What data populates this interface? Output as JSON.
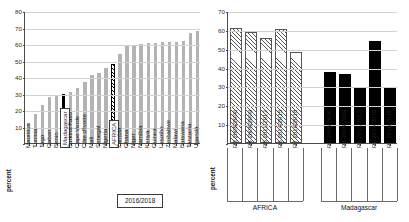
{
  "units_label": "percent",
  "legend": {
    "period_label": "2016/2018"
  },
  "chart_data": [
    {
      "type": "bar",
      "id": "country-ranking",
      "title": "",
      "xlabel": "",
      "ylabel": "percent",
      "ylim": [
        0,
        80
      ],
      "yticks": [
        10,
        20,
        30,
        40,
        50,
        60,
        70,
        80
      ],
      "grid": true,
      "legend_position": "inside-bottom-right",
      "annotations": [
        "2016/2018"
      ],
      "highlight_categories": [
        "Madagascar",
        "AFRICA"
      ],
      "categories": [
        "Mauritius",
        "Tunisia",
        "Togo",
        "Gabon",
        "Benin",
        "Madagascar",
        "Burkina Faso",
        "Cape Verde",
        "Côte d'Ivoire",
        "Mali",
        "Senegal",
        "Nigeria",
        "AFRICA",
        "Zambia",
        "Ghana",
        "Niger",
        "Namibia",
        "Kenya",
        "Guinea",
        "Lesotho",
        "Zimbabwe",
        "Malawi",
        "Botswana",
        "Tanzania",
        "Uganda"
      ],
      "values": [
        12.0,
        17.5,
        23.0,
        28.0,
        28.5,
        30.0,
        31.0,
        33.5,
        37.0,
        41.0,
        42.5,
        45.5,
        48.0,
        54.0,
        58.5,
        59.5,
        60.0,
        60.5,
        60.5,
        61.0,
        61.0,
        61.5,
        62.0,
        66.5,
        68.0
      ],
      "styles": [
        "grey",
        "grey",
        "grey",
        "grey",
        "grey",
        "black",
        "grey",
        "grey",
        "grey",
        "grey",
        "grey",
        "grey",
        "hatch",
        "grey",
        "grey",
        "grey",
        "grey",
        "grey",
        "grey",
        "grey",
        "grey",
        "grey",
        "grey",
        "grey",
        "grey"
      ]
    },
    {
      "type": "bar",
      "id": "rounds-comparison",
      "title": "",
      "xlabel": "",
      "ylabel": "percent",
      "ylim": [
        0,
        70
      ],
      "yticks": [
        10,
        20,
        30,
        40,
        50,
        60,
        70
      ],
      "grid": true,
      "groups": [
        "AFRICA",
        "Madagascar"
      ],
      "categories": [
        "R3  2005/2006",
        "R4  2008/2009",
        "R5  2011/2013",
        "R6  2014/2015",
        "R7  2016/2018"
      ],
      "series": [
        {
          "name": "AFRICA",
          "style": "hatch-lt",
          "values": [
            61.0,
            59.0,
            55.5,
            60.5,
            48.5
          ]
        },
        {
          "name": "Madagascar",
          "style": "black",
          "values": [
            37.5,
            36.5,
            29.5,
            54.0,
            29.5
          ]
        }
      ]
    }
  ]
}
